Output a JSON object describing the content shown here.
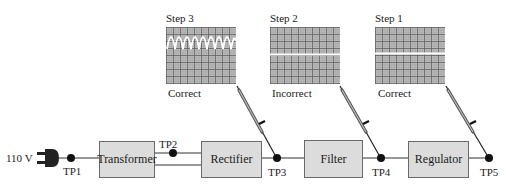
{
  "source": {
    "voltage_label": "110 V",
    "icon": "power-plug-icon"
  },
  "blocks": [
    {
      "id": "transformer",
      "label": "Transformer"
    },
    {
      "id": "rectifier",
      "label": "Rectifier"
    },
    {
      "id": "filter",
      "label": "Filter"
    },
    {
      "id": "regulator",
      "label": "Regulator"
    }
  ],
  "test_points": [
    "TP1",
    "TP2",
    "TP3",
    "TP4",
    "TP5"
  ],
  "scopes": [
    {
      "step": "Step 3",
      "result": "Correct",
      "trace": "full-wave rectified waveform",
      "probe_at": "TP3"
    },
    {
      "step": "Step 2",
      "result": "Incorrect",
      "trace": "flat line (no signal)",
      "probe_at": "TP4"
    },
    {
      "step": "Step 1",
      "result": "Correct",
      "trace": "flat DC line",
      "probe_at": "TP5"
    }
  ],
  "colors": {
    "block_fill": "#dcdcdc",
    "screen_fill": "#c3c3c3",
    "trace": "#ffffff",
    "wire": "#1a1a1a"
  }
}
